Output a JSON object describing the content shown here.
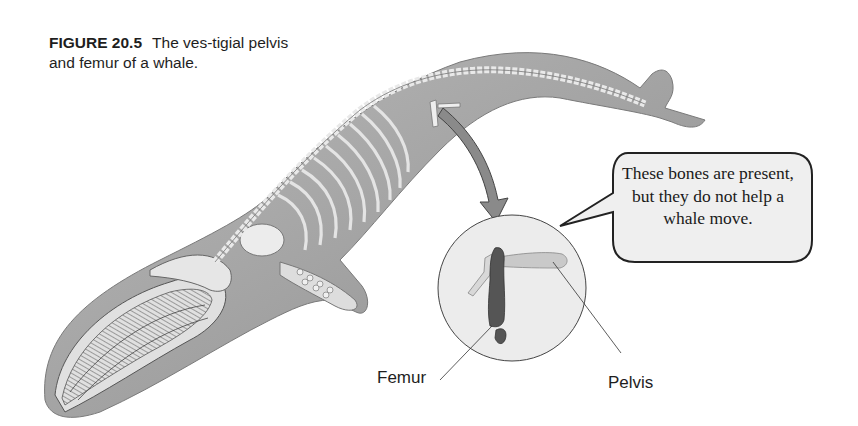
{
  "figure": {
    "label": "FIGURE 20.5",
    "caption": "The vestigial pelvis and femur of a whale.",
    "caption_display": "The ves-tigial pelvis and femur of a whale."
  },
  "speech_bubble": {
    "text": "These bones are present, but they do not help a whale move."
  },
  "callouts": {
    "femur": "Femur",
    "pelvis": "Pelvis"
  },
  "illustration": {
    "subject": "whale-skeleton",
    "detail_view": "vestigial-pelvis-and-femur",
    "colors": {
      "body": "#a8a8a8",
      "bone": "#e2e2e2",
      "femur": "#555555",
      "pelvis": "#c8c8c8",
      "detail_circle_fill": "#ececec",
      "arrow": "#8a8a8a",
      "bubble_fill": "#efefef"
    }
  }
}
